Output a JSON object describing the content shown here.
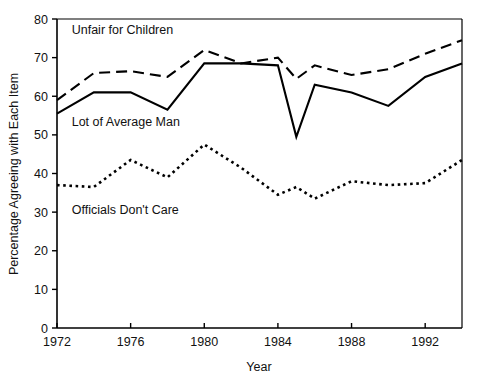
{
  "chart_data": {
    "type": "line",
    "title": "",
    "xlabel": "Year",
    "ylabel": "Percentage Agreeing with Each Item",
    "xlim": [
      1972,
      1994
    ],
    "ylim": [
      0,
      80
    ],
    "grid": false,
    "legend_position": "inline-annotations",
    "x_ticks": [
      "1972",
      "1976",
      "1980",
      "1984",
      "1988",
      "1992"
    ],
    "x_tick_values": [
      1972,
      1976,
      1980,
      1984,
      1988,
      1992
    ],
    "y_ticks": [
      "0",
      "10",
      "20",
      "30",
      "40",
      "50",
      "60",
      "70",
      "80"
    ],
    "y_tick_values": [
      0,
      10,
      20,
      30,
      40,
      50,
      60,
      70,
      80
    ],
    "x": [
      1972,
      1974,
      1976,
      1978,
      1980,
      1982,
      1984,
      1985,
      1986,
      1988,
      1990,
      1992,
      1994
    ],
    "series": [
      {
        "name": "Unfair for Children",
        "style": "dashed",
        "color": "#000000",
        "values": [
          59,
          66,
          66.5,
          65,
          72,
          68.5,
          70,
          64.5,
          68,
          65.5,
          67,
          71,
          74.5
        ]
      },
      {
        "name": "Lot of Average Man",
        "style": "solid",
        "color": "#000000",
        "values": [
          55.5,
          61,
          61,
          56.5,
          68.5,
          68.5,
          68,
          49.5,
          63,
          61,
          57.5,
          65,
          68.5
        ]
      },
      {
        "name": "Officials Don't Care",
        "style": "dotted",
        "color": "#000000",
        "values": [
          37,
          36.5,
          43.5,
          39,
          47.5,
          41.5,
          34.5,
          36.5,
          33.5,
          38,
          37,
          37.5,
          43.5
        ]
      }
    ],
    "annotations": [
      {
        "text": "Unfair for Children",
        "x": 1972.8,
        "y": 76.0
      },
      {
        "text": "Lot of Average Man",
        "x": 1972.8,
        "y": 52.2
      },
      {
        "text": "Officials Don't Care",
        "x": 1972.8,
        "y": 29.5
      }
    ]
  },
  "axis": {
    "x_title": "Year",
    "y_title": "Percentage Agreeing with Each Item"
  }
}
